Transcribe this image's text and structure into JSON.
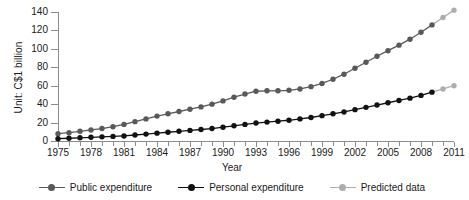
{
  "chart_data": {
    "type": "line",
    "title": "",
    "xlabel": "Year",
    "ylabel": "Unit: C$1 billion",
    "xlim": [
      1975,
      2011
    ],
    "ylim": [
      0,
      140
    ],
    "yticks": [
      0,
      20,
      40,
      60,
      80,
      100,
      120,
      140
    ],
    "xticks": [
      1975,
      1978,
      1981,
      1984,
      1987,
      1990,
      1993,
      1996,
      1999,
      2002,
      2005,
      2008,
      2011
    ],
    "x": [
      1975,
      1976,
      1977,
      1978,
      1979,
      1980,
      1981,
      1982,
      1983,
      1984,
      1985,
      1986,
      1987,
      1988,
      1989,
      1990,
      1991,
      1992,
      1993,
      1994,
      1995,
      1996,
      1997,
      1998,
      1999,
      2000,
      2001,
      2002,
      2003,
      2004,
      2005,
      2006,
      2007,
      2008,
      2009,
      2010,
      2011
    ],
    "grid": false,
    "legend_position": "bottom",
    "series": [
      {
        "name": "Public expenditure",
        "color": "#595959",
        "marker": "circle",
        "values": [
          8,
          9,
          10.5,
          12,
          13.5,
          15.5,
          18,
          21,
          24,
          27,
          29.5,
          32,
          34.5,
          37,
          40,
          43.5,
          47.5,
          51,
          54,
          54.5,
          54.5,
          55,
          56.5,
          59,
          62.5,
          67,
          72.5,
          79,
          85.5,
          92,
          98,
          104,
          110.5,
          118,
          126,
          134,
          142
        ],
        "predicted_from_index": 35
      },
      {
        "name": "Personal expenditure",
        "color": "#111111",
        "marker": "circle",
        "values": [
          2.5,
          3,
          3.5,
          4,
          4.5,
          5,
          5.5,
          6.5,
          7.5,
          8.5,
          9.5,
          10.5,
          11.5,
          12.5,
          13.5,
          15,
          16.5,
          18,
          19.5,
          20.5,
          21.5,
          22.5,
          24,
          25.5,
          27.5,
          29.5,
          31.5,
          34,
          36.5,
          39,
          41.5,
          44,
          46.5,
          49.5,
          53,
          56.5,
          60
        ],
        "predicted_from_index": 35
      },
      {
        "name": "Predicted data",
        "color": "#adadad",
        "marker": "circle",
        "note": "final segment of both expenditure curves (2009-2011)"
      }
    ]
  },
  "axes": {
    "y_title": "Unit: C$1 billion",
    "x_title": "Year",
    "y_tick_labels": [
      "0",
      "20",
      "40",
      "60",
      "80",
      "100",
      "120",
      "140"
    ],
    "x_tick_labels": [
      "1975",
      "1978",
      "1981",
      "1984",
      "1987",
      "1990",
      "1993",
      "1996",
      "1999",
      "2002",
      "2005",
      "2008",
      "2011"
    ]
  },
  "legend": {
    "items": [
      {
        "label": "Public expenditure",
        "color": "#595959"
      },
      {
        "label": "Personal expenditure",
        "color": "#111111"
      },
      {
        "label": "Predicted data",
        "color": "#adadad"
      }
    ]
  },
  "colors": {
    "public": "#595959",
    "personal": "#111111",
    "predicted": "#adadad",
    "axis": "#8c8c8c",
    "background": "#ffffff"
  }
}
